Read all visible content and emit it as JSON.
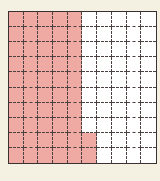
{
  "figure": {
    "type": "hundred-grid",
    "rows": 10,
    "columns": 10,
    "total_cells": 100,
    "shaded_cells": 52,
    "shaded_description": "first 5 columns fully shaded, plus bottom 2 cells of column 6",
    "shaded_full_columns": 5,
    "partial_column": {
      "column": 6,
      "shaded_rows_from_bottom": 2
    },
    "colors": {
      "shaded": "#eeaaa3",
      "unshaded": "#ffffff",
      "background": "#f4f1e3",
      "grid_lines": "#4a4040"
    }
  }
}
